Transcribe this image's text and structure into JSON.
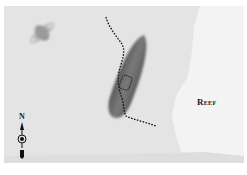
{
  "map": {
    "features": [
      {
        "type": "reef",
        "label": "Reef"
      },
      {
        "type": "shipwreck",
        "label": ""
      },
      {
        "type": "small-craft",
        "label": ""
      },
      {
        "type": "dotted-route",
        "label": ""
      }
    ],
    "compass": {
      "label": "N"
    },
    "colors": {
      "water": "#e4e4e4",
      "reef": "#f3f3f3",
      "wreck": "#6e6e6e",
      "route": "#111111",
      "border": "#ffffff"
    }
  }
}
